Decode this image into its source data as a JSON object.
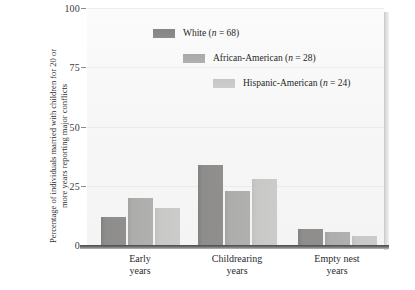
{
  "chart_data": {
    "type": "bar",
    "title": "",
    "subtitle": "",
    "xlabel": "",
    "ylabel": "Percentage of individuals married with children for 20 or more years reporting major conflicts",
    "ylim": [
      0,
      100
    ],
    "yticks": [
      0,
      25,
      50,
      75,
      100
    ],
    "ytick_labels": [
      "0",
      "25",
      "50",
      "75",
      "100"
    ],
    "grid": false,
    "legend_position": "upper-center-staggered",
    "categories": [
      "Early years",
      "Childrearing years",
      "Empty nest years"
    ],
    "category_lines": [
      [
        "Early",
        "years"
      ],
      [
        "Childrearing",
        "years"
      ],
      [
        "Empty nest",
        "years"
      ]
    ],
    "series": [
      {
        "name": "White",
        "n": 68,
        "legend": "White (n = 68)",
        "color": "#8b8b89",
        "values": [
          12,
          34,
          7
        ]
      },
      {
        "name": "African-American",
        "n": 28,
        "legend": "African-American (n = 28)",
        "color": "#adadab",
        "values": [
          20,
          23,
          6
        ]
      },
      {
        "name": "Hispanic-American",
        "n": 24,
        "legend": "Hispanic-American (n = 24)",
        "color": "#c8c8c6",
        "values": [
          16,
          28,
          4
        ]
      }
    ]
  },
  "legend": {
    "items": [
      {
        "name_text": "White",
        "stat_text": " (",
        "n_label": "n",
        "eq_text": " = 68)",
        "full": "White (n = 68)"
      },
      {
        "name_text": "African-American",
        "stat_text": " (",
        "n_label": "n",
        "eq_text": " = 28)",
        "full": "African-American (n = 28)"
      },
      {
        "name_text": "Hispanic-American",
        "stat_text": " (",
        "n_label": "n",
        "eq_text": " = 24)",
        "full": "Hispanic-American (n = 24)"
      }
    ]
  },
  "axis": {
    "y_title": "Percentage of individuals married with children for 20 or more years reporting major conflicts",
    "y_tick_0": "0",
    "y_tick_25": "25",
    "y_tick_50": "50",
    "y_tick_75": "75",
    "y_tick_100": "100"
  },
  "xaxis": {
    "group1_line1": "Early",
    "group1_line2": "years",
    "group2_line1": "Childrearing",
    "group2_line2": "years",
    "group3_line1": "Empty nest",
    "group3_line2": "years"
  },
  "colors": {
    "series_white": "#8b8b89",
    "series_african_american": "#adadab",
    "series_hispanic_american": "#c8c8c6",
    "plot_background": "#f7f7f7",
    "axis": "#5a5a5a",
    "text": "#2b2b2b"
  }
}
